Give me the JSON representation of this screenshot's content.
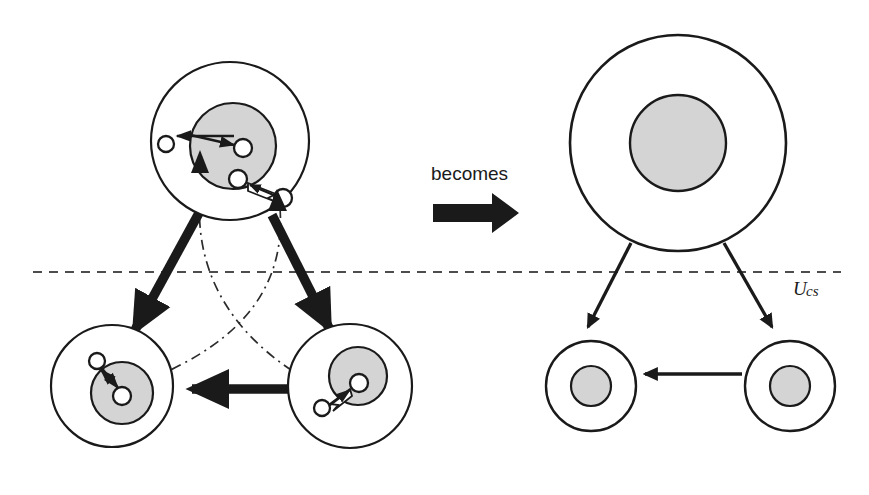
{
  "figure": {
    "labels": {
      "becomes": "becomes",
      "boundary_main": "U",
      "boundary_sub": "cs",
      "boundary_full": "Ucs"
    },
    "colors": {
      "stroke": "#1a1a1a",
      "inner_fill": "#d4d4d4",
      "node_fill": "#ffffff",
      "background": "#ffffff",
      "dash_line": "#555555"
    },
    "panels": [
      {
        "id": "left-detailed",
        "name": "detailed-view",
        "agents": [
          {
            "id": "top-agent",
            "outer": {
              "cx": 230,
              "cy": 141,
              "r": 79
            },
            "inner": {
              "cx": 233,
              "cy": 146,
              "r": 43
            },
            "nodes": [
              {
                "id": "n1",
                "cx": 166,
                "cy": 144,
                "r": 8
              },
              {
                "id": "n2",
                "cx": 243,
                "cy": 148,
                "r": 9
              },
              {
                "id": "n3",
                "cx": 238,
                "cy": 179,
                "r": 9
              },
              {
                "id": "n4",
                "cx": 283,
                "cy": 198,
                "r": 9
              }
            ]
          },
          {
            "id": "bottom-left-agent",
            "outer": {
              "cx": 112,
              "cy": 386,
              "r": 61
            },
            "inner": {
              "cx": 122,
              "cy": 393,
              "r": 31
            },
            "nodes": [
              {
                "id": "n5",
                "cx": 97,
                "cy": 361,
                "r": 8
              },
              {
                "id": "n6",
                "cx": 122,
                "cy": 396,
                "r": 9
              }
            ]
          },
          {
            "id": "bottom-right-agent",
            "outer": {
              "cx": 350,
              "cy": 386,
              "r": 62
            },
            "inner": {
              "cx": 358,
              "cy": 376,
              "r": 29
            },
            "nodes": [
              {
                "id": "n7",
                "cx": 359,
                "cy": 383,
                "r": 9
              },
              {
                "id": "n8",
                "cx": 322,
                "cy": 408,
                "r": 8
              }
            ]
          }
        ]
      },
      {
        "id": "right-abstract",
        "name": "abstract-view",
        "agents": [
          {
            "id": "top-agent-abstract",
            "outer": {
              "cx": 678,
              "cy": 143,
              "r": 108
            },
            "inner": {
              "cx": 678,
              "cy": 143,
              "r": 48
            }
          },
          {
            "id": "bottom-left-agent-abstract",
            "outer": {
              "cx": 591,
              "cy": 386,
              "r": 45
            },
            "inner": {
              "cx": 591,
              "cy": 386,
              "r": 20
            }
          },
          {
            "id": "bottom-right-agent-abstract",
            "outer": {
              "cx": 790,
              "cy": 386,
              "r": 45
            },
            "inner": {
              "cx": 790,
              "cy": 386,
              "r": 20
            }
          }
        ]
      }
    ],
    "boundary_line": {
      "x1": 33,
      "y1": 272,
      "x2": 841,
      "y2": 272
    }
  }
}
